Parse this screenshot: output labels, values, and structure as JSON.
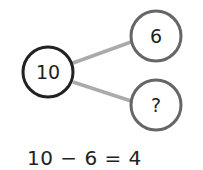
{
  "diagram": {
    "type": "number-bond",
    "whole": {
      "label": "10",
      "cx": 48,
      "cy": 72,
      "r": 25,
      "stroke": "#222222"
    },
    "parts": [
      {
        "label": "6",
        "cx": 156,
        "cy": 36,
        "r": 25,
        "stroke": "#666666"
      },
      {
        "label": "?",
        "cx": 156,
        "cy": 105,
        "r": 25,
        "stroke": "#666666"
      }
    ],
    "connector_color": "#aaaaaa"
  },
  "equation": {
    "text": "10 − 6 = 4"
  }
}
